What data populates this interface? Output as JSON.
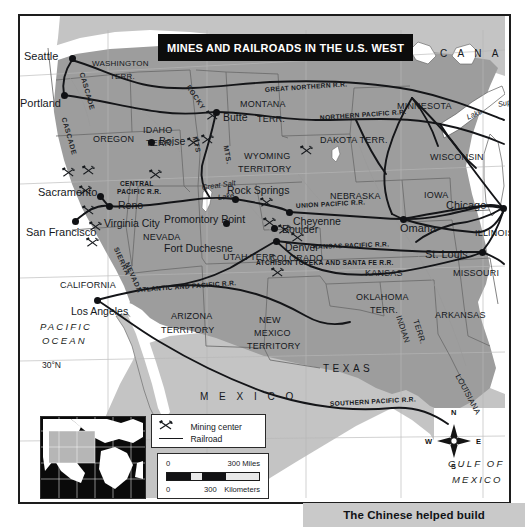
{
  "title": "MINES AND RAILROADS IN THE U.S. WEST",
  "caption": "The Chinese helped build",
  "colors": {
    "land_us": "#9d9d9d",
    "land_foreign": "#c4c4c4",
    "water": "#ffffff",
    "ink": "#15181c",
    "banner_bg": "#0c0c0c",
    "banner_fg": "#ffffff",
    "caption_bg": "#c9c9c9"
  },
  "cities": [
    {
      "name": "Seattle",
      "x": 52,
      "y": 42,
      "dx": -48,
      "dy": -7,
      "dot": true
    },
    {
      "name": "Portland",
      "x": 44,
      "y": 79,
      "dx": -44,
      "dy": 3,
      "dot": true
    },
    {
      "name": "Boise",
      "x": 131,
      "y": 126,
      "dx": 8,
      "dy": -6,
      "dot": true
    },
    {
      "name": "Butte",
      "x": 196,
      "y": 96,
      "dx": 7,
      "dy": 0,
      "dot": true
    },
    {
      "name": "Sacramento",
      "x": 80,
      "y": 180,
      "dx": -62,
      "dy": -9,
      "dot": true
    },
    {
      "name": "Reno",
      "x": 89,
      "y": 190,
      "dx": 9,
      "dy": -6,
      "dot": true
    },
    {
      "name": "Virginia City",
      "x": 73,
      "y": 198,
      "dx": 11,
      "dy": 4,
      "dot": false
    },
    {
      "name": "San Francisco",
      "x": 55,
      "y": 205,
      "dx": -49,
      "dy": 6,
      "dot": true
    },
    {
      "name": "Rock Springs",
      "x": 215,
      "y": 183,
      "dx": -8,
      "dy": -14,
      "dot": true
    },
    {
      "name": "Promontory Point",
      "x": 206,
      "y": 207,
      "dx": -62,
      "dy": -9,
      "dot": true
    },
    {
      "name": "Fort Duchesne",
      "x": 196,
      "y": 221,
      "dx": -52,
      "dy": 6,
      "dot": false
    },
    {
      "name": "Boulder",
      "x": 254,
      "y": 212,
      "dx": 8,
      "dy": -4,
      "dot": true
    },
    {
      "name": "Denver",
      "x": 256,
      "y": 225,
      "dx": 9,
      "dy": 1,
      "dot": true
    },
    {
      "name": "Cheyenne",
      "x": 269,
      "y": 196,
      "dx": 4,
      "dy": 4,
      "dot": true
    },
    {
      "name": "Omaha",
      "x": 383,
      "y": 203,
      "dx": -3,
      "dy": 4,
      "dot": true
    },
    {
      "name": "Chicago",
      "x": 483,
      "y": 192,
      "dx": -57,
      "dy": -8,
      "dot": true
    },
    {
      "name": "St. Louis",
      "x": 462,
      "y": 236,
      "dx": -57,
      "dy": -3,
      "dot": true
    },
    {
      "name": "Los Angeles",
      "x": 77,
      "y": 284,
      "dx": -26,
      "dy": 6,
      "dot": true
    }
  ],
  "states": [
    {
      "name": "WASHINGTON",
      "x": 72,
      "y": 44,
      "size": "sm"
    },
    {
      "name": "TERR.",
      "x": 90,
      "y": 57,
      "size": "sm"
    },
    {
      "name": "OREGON",
      "x": 73,
      "y": 119,
      "size": "md"
    },
    {
      "name": "IDAHO",
      "x": 123,
      "y": 110,
      "size": "md"
    },
    {
      "name": "TERR.",
      "x": 126,
      "y": 123,
      "size": "md"
    },
    {
      "name": "MONTANA",
      "x": 220,
      "y": 84,
      "size": "md"
    },
    {
      "name": "TERR.",
      "x": 237,
      "y": 99,
      "size": "md"
    },
    {
      "name": "WYOMING",
      "x": 224,
      "y": 136,
      "size": "md"
    },
    {
      "name": "TERRITORY",
      "x": 218,
      "y": 149,
      "size": "md"
    },
    {
      "name": "DAKOTA TERR.",
      "x": 300,
      "y": 120,
      "size": "md"
    },
    {
      "name": "MINNESOTA",
      "x": 377,
      "y": 86,
      "size": "md"
    },
    {
      "name": "WISCONSIN",
      "x": 410,
      "y": 137,
      "size": "md"
    },
    {
      "name": "IOWA",
      "x": 404,
      "y": 175,
      "size": "md"
    },
    {
      "name": "NEBRASKA",
      "x": 310,
      "y": 176,
      "size": "md"
    },
    {
      "name": "ILLINOIS",
      "x": 455,
      "y": 213,
      "size": "md"
    },
    {
      "name": "MISSOURI",
      "x": 433,
      "y": 253,
      "size": "md"
    },
    {
      "name": "NEVADA",
      "x": 123,
      "y": 217,
      "size": "md"
    },
    {
      "name": "UTAH TERR.",
      "x": 203,
      "y": 237,
      "size": "md"
    },
    {
      "name": "COLORADO",
      "x": 250,
      "y": 238,
      "size": "md"
    },
    {
      "name": "KANSAS",
      "x": 345,
      "y": 253,
      "size": "md"
    },
    {
      "name": "CALIFORNIA",
      "x": 40,
      "y": 265,
      "size": "md"
    },
    {
      "name": "ARIZONA",
      "x": 151,
      "y": 296,
      "size": "md"
    },
    {
      "name": "TERRITORY",
      "x": 141,
      "y": 310,
      "size": "md"
    },
    {
      "name": "NEW",
      "x": 239,
      "y": 300,
      "size": "md"
    },
    {
      "name": "MEXICO",
      "x": 234,
      "y": 313,
      "size": "md"
    },
    {
      "name": "TERRITORY",
      "x": 227,
      "y": 326,
      "size": "md"
    },
    {
      "name": "OKLAHOMA",
      "x": 336,
      "y": 277,
      "size": "md"
    },
    {
      "name": "TERR.",
      "x": 350,
      "y": 290,
      "size": "md"
    },
    {
      "name": "ARKANSAS",
      "x": 415,
      "y": 295,
      "size": "md"
    },
    {
      "name": "TEXAS",
      "x": 303,
      "y": 348,
      "size": "wide"
    }
  ],
  "rotated_states": [
    {
      "name": "INDIAN",
      "x": 378,
      "y": 296,
      "rot": 72
    },
    {
      "name": "TERR.",
      "x": 395,
      "y": 300,
      "rot": 72
    },
    {
      "name": "LOUISIANA",
      "x": 437,
      "y": 355,
      "rot": 62
    }
  ],
  "countries": [
    {
      "name": "C A N A D A",
      "x": 420,
      "y": 33
    },
    {
      "name": "M E X I C O",
      "x": 180,
      "y": 376
    }
  ],
  "oceans": [
    {
      "name": "PACIFIC",
      "x": 20,
      "y": 306
    },
    {
      "name": "OCEAN",
      "x": 22,
      "y": 320
    },
    {
      "name": "GULF OF",
      "x": 428,
      "y": 443
    },
    {
      "name": "MEXICO",
      "x": 432,
      "y": 459
    }
  ],
  "lakes": [
    {
      "name": "Lake",
      "x": 447,
      "y": 98,
      "rot": -24
    },
    {
      "name": "Superior",
      "x": 478,
      "y": 85,
      "rot": -12
    },
    {
      "name": "Lake",
      "x": 494,
      "y": 168,
      "rot": -76
    },
    {
      "name": "Michigan",
      "x": 501,
      "y": 140,
      "rot": -76
    },
    {
      "name": "Great Salt",
      "x": 182,
      "y": 168,
      "rot": -8
    },
    {
      "name": "Lake",
      "x": 198,
      "y": 178,
      "rot": -8
    }
  ],
  "railroads": [
    {
      "name": "GREAT NORTHERN R.R.",
      "x": 245,
      "y": 71,
      "rot": -4
    },
    {
      "name": "NORTHERN PACIFIC R.R.",
      "x": 300,
      "y": 99,
      "rot": -4
    },
    {
      "name": "CENTRAL",
      "x": 100,
      "y": 165,
      "rot": 0
    },
    {
      "name": "PACIFIC R.R.",
      "x": 97,
      "y": 173,
      "rot": 0
    },
    {
      "name": "UNION PACIFIC R.R.",
      "x": 276,
      "y": 187,
      "rot": -3
    },
    {
      "name": "KANSAS PACIFIC R.R.",
      "x": 293,
      "y": 228,
      "rot": -2
    },
    {
      "name": "ATCHISON TOPEKA AND SANTA FE R.R.",
      "x": 236,
      "y": 244,
      "rot": 0
    },
    {
      "name": "ATLANTIC AND PACIFIC R.R.",
      "x": 118,
      "y": 271,
      "rot": -4
    },
    {
      "name": "SOUTHERN PACIFIC R.R.",
      "x": 310,
      "y": 385,
      "rot": -3
    }
  ],
  "ranges": [
    {
      "name": "CASCADE",
      "x": 44,
      "y": 98,
      "rot": 74
    },
    {
      "name": "CASCADE",
      "x": 62,
      "y": 53,
      "rot": 74
    },
    {
      "name": "ROCKY",
      "x": 168,
      "y": 66,
      "rot": 56
    },
    {
      "name": "MTS",
      "x": 175,
      "y": 117,
      "rot": 78
    },
    {
      "name": "MTS.",
      "x": 206,
      "y": 126,
      "rot": 80
    },
    {
      "name": "SIERRA",
      "x": 96,
      "y": 228,
      "rot": 66
    },
    {
      "name": "NEVADA",
      "x": 107,
      "y": 243,
      "rot": 66
    }
  ],
  "mines": [
    {
      "x": 42,
      "y": 148
    },
    {
      "x": 62,
      "y": 146
    },
    {
      "x": 59,
      "y": 166
    },
    {
      "x": 62,
      "y": 186
    },
    {
      "x": 69,
      "y": 202
    },
    {
      "x": 66,
      "y": 218
    },
    {
      "x": 129,
      "y": 150
    },
    {
      "x": 167,
      "y": 118
    },
    {
      "x": 186,
      "y": 91
    },
    {
      "x": 181,
      "y": 115
    },
    {
      "x": 240,
      "y": 178
    },
    {
      "x": 280,
      "y": 126
    },
    {
      "x": 243,
      "y": 198
    },
    {
      "x": 258,
      "y": 205
    },
    {
      "x": 271,
      "y": 213
    },
    {
      "x": 251,
      "y": 248
    }
  ],
  "coordinates": [
    {
      "label": "30°N",
      "x": 22,
      "y": 345
    },
    {
      "label": "115°W",
      "x": 88,
      "y": 487
    },
    {
      "label": "110°W",
      "x": 187,
      "y": 487
    },
    {
      "label": "95°W",
      "x": 381,
      "y": 487
    },
    {
      "label": "90°W",
      "x": 463,
      "y": 487
    }
  ],
  "legend": {
    "mining_label": "Mining center",
    "railroad_label": "Railroad",
    "mining_icon": "crossed-pick-and-hammer-icon",
    "railroad_icon": "rail-line-icon"
  },
  "scale": {
    "miles_zero": "0",
    "miles_value": "300 Miles",
    "km_zero": "0",
    "km_value": "300",
    "km_unit": "Kilometers"
  },
  "compass": {
    "n": "N",
    "e": "E",
    "s": "S",
    "w": "W"
  }
}
